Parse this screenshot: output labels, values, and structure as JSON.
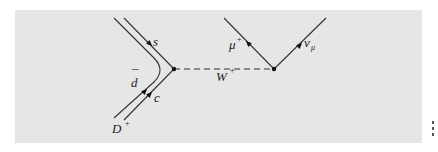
{
  "diagram": {
    "type": "feynman",
    "background_color": "#e6e6e6",
    "line_color": "#333333",
    "vertices": [
      {
        "id": "v1",
        "x": 174,
        "y": 69
      },
      {
        "id": "v2",
        "x": 274,
        "y": 69
      }
    ],
    "labels": {
      "s": "s",
      "dbar_base": "d",
      "dbar_bar": "¯",
      "c": "c",
      "D": "D",
      "D_sup": "+",
      "W": "W",
      "W_sup": "+",
      "mu": "μ",
      "mu_sup": "+",
      "nu": "ν",
      "nu_sub": "μ"
    },
    "particles": [
      {
        "name": "s",
        "kind": "quark",
        "line": "outgoing"
      },
      {
        "name": "d̄",
        "kind": "antiquark",
        "line": "curved"
      },
      {
        "name": "c",
        "kind": "quark",
        "line": "incoming"
      },
      {
        "name": "D+",
        "kind": "meson",
        "line": "incoming"
      },
      {
        "name": "W+",
        "kind": "boson",
        "line": "dashed"
      },
      {
        "name": "μ+",
        "kind": "lepton",
        "line": "outgoing"
      },
      {
        "name": "νμ",
        "kind": "neutrino",
        "line": "outgoing"
      }
    ]
  }
}
